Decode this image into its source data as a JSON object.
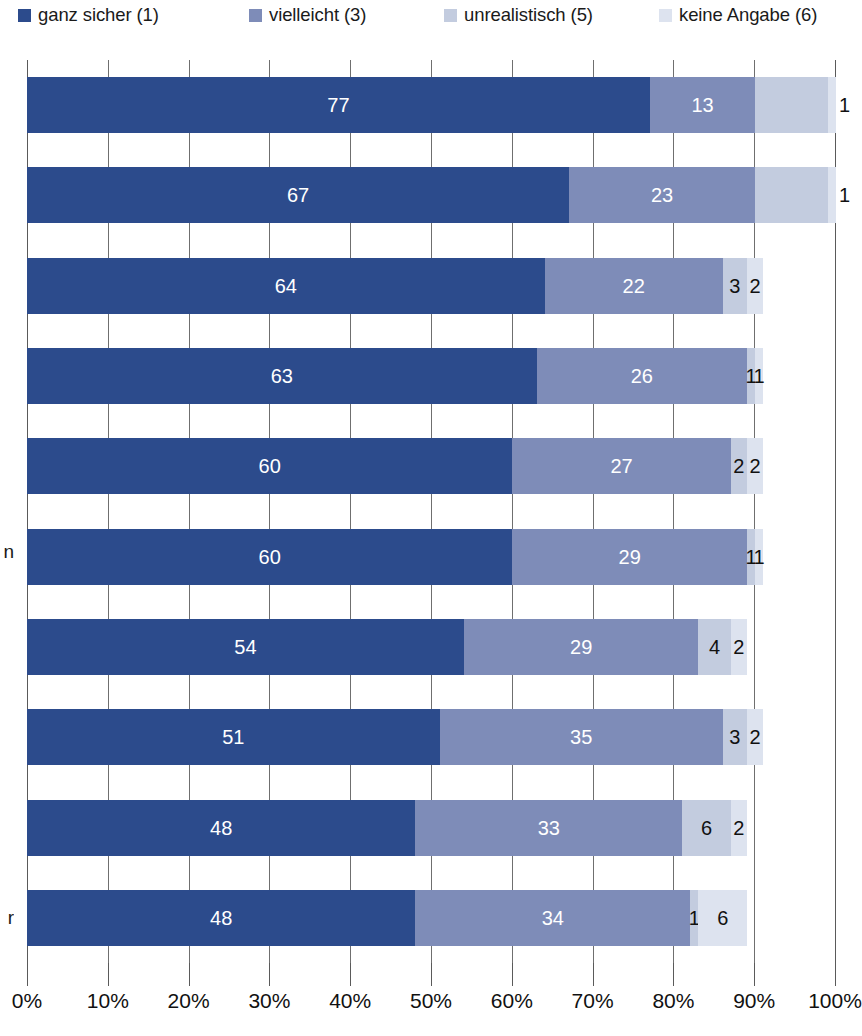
{
  "legend": {
    "items": [
      {
        "label": "ganz sicher (1)",
        "color": "#2c4b8c",
        "x": 18,
        "icon": "legend-swatch-series-1"
      },
      {
        "label": "vielleicht (3)",
        "color": "#7e8cb8",
        "x": 249,
        "icon": "legend-swatch-series-3"
      },
      {
        "label": "unrealistisch (5)",
        "color": "#c3ccdf",
        "x": 444,
        "icon": "legend-swatch-series-5"
      },
      {
        "label": "keine Angabe (6)",
        "color": "#dde3ef",
        "x": 659,
        "icon": "legend-swatch-series-6"
      }
    ]
  },
  "axis": {
    "ticks": [
      "0%",
      "10%",
      "20%",
      "30%",
      "40%",
      "50%",
      "60%",
      "70%",
      "80%",
      "90%",
      "100%"
    ],
    "min": 0,
    "max": 100,
    "step": 10,
    "unit": "%"
  },
  "category_fragments": [
    {
      "text": "n",
      "top": 542
    },
    {
      "text": "r",
      "top": 908
    }
  ],
  "chart_data": {
    "type": "bar",
    "orientation": "horizontal",
    "stacked": true,
    "normalized": true,
    "title": "",
    "xlabel": "",
    "ylabel": "",
    "xlim": [
      0,
      100
    ],
    "grid": true,
    "legend_position": "top",
    "categories": [
      "",
      "",
      "",
      "",
      "",
      "",
      "",
      "",
      "",
      ""
    ],
    "series": [
      {
        "name": "ganz sicher (1)",
        "color": "#2c4b8c",
        "values": [
          77,
          67,
          64,
          63,
          60,
          60,
          54,
          51,
          48,
          48
        ]
      },
      {
        "name": "vielleicht (3)",
        "color": "#7e8cb8",
        "values": [
          13,
          23,
          22,
          26,
          27,
          29,
          29,
          35,
          33,
          34
        ]
      },
      {
        "name": "unrealistisch (5)",
        "color": "#c3ccdf",
        "values": [
          9,
          9,
          3,
          1,
          2,
          1,
          4,
          3,
          6,
          1
        ]
      },
      {
        "name": "keine Angabe (6)",
        "color": "#dde3ef",
        "values": [
          1,
          1,
          2,
          1,
          2,
          1,
          2,
          2,
          2,
          6
        ]
      }
    ],
    "rows": [
      {
        "index": 0,
        "segments": [
          {
            "series": "ganz sicher (1)",
            "value": 77,
            "label": "77",
            "label_style": "inside"
          },
          {
            "series": "vielleicht (3)",
            "value": 13,
            "label": "13",
            "label_style": "inside"
          },
          {
            "series": "unrealistisch (5)",
            "value": 9,
            "label": "",
            "label_style": "none"
          },
          {
            "series": "keine Angabe (6)",
            "value": 1,
            "label": "1",
            "label_style": "outside-right"
          }
        ]
      },
      {
        "index": 1,
        "segments": [
          {
            "series": "ganz sicher (1)",
            "value": 67,
            "label": "67",
            "label_style": "inside"
          },
          {
            "series": "vielleicht (3)",
            "value": 23,
            "label": "23",
            "label_style": "inside"
          },
          {
            "series": "unrealistisch (5)",
            "value": 9,
            "label": "",
            "label_style": "none"
          },
          {
            "series": "keine Angabe (6)",
            "value": 1,
            "label": "1",
            "label_style": "outside-right"
          }
        ]
      },
      {
        "index": 2,
        "segments": [
          {
            "series": "ganz sicher (1)",
            "value": 64,
            "label": "64",
            "label_style": "inside"
          },
          {
            "series": "vielleicht (3)",
            "value": 22,
            "label": "22",
            "label_style": "inside"
          },
          {
            "series": "unrealistisch (5)",
            "value": 3,
            "label": "3",
            "label_style": "outside"
          },
          {
            "series": "keine Angabe (6)",
            "value": 2,
            "label": "2",
            "label_style": "outside"
          }
        ]
      },
      {
        "index": 3,
        "segments": [
          {
            "series": "ganz sicher (1)",
            "value": 63,
            "label": "63",
            "label_style": "inside"
          },
          {
            "series": "vielleicht (3)",
            "value": 26,
            "label": "26",
            "label_style": "inside"
          },
          {
            "series": "unrealistisch (5)",
            "value": 1,
            "label": "1",
            "label_style": "outside"
          },
          {
            "series": "keine Angabe (6)",
            "value": 1,
            "label": "1",
            "label_style": "outside"
          }
        ]
      },
      {
        "index": 4,
        "segments": [
          {
            "series": "ganz sicher (1)",
            "value": 60,
            "label": "60",
            "label_style": "inside"
          },
          {
            "series": "vielleicht (3)",
            "value": 27,
            "label": "27",
            "label_style": "inside"
          },
          {
            "series": "unrealistisch (5)",
            "value": 2,
            "label": "2",
            "label_style": "outside"
          },
          {
            "series": "keine Angabe (6)",
            "value": 2,
            "label": "2",
            "label_style": "outside"
          }
        ]
      },
      {
        "index": 5,
        "segments": [
          {
            "series": "ganz sicher (1)",
            "value": 60,
            "label": "60",
            "label_style": "inside"
          },
          {
            "series": "vielleicht (3)",
            "value": 29,
            "label": "29",
            "label_style": "inside"
          },
          {
            "series": "unrealistisch (5)",
            "value": 1,
            "label": "1",
            "label_style": "outside"
          },
          {
            "series": "keine Angabe (6)",
            "value": 1,
            "label": "1",
            "label_style": "outside"
          }
        ]
      },
      {
        "index": 6,
        "segments": [
          {
            "series": "ganz sicher (1)",
            "value": 54,
            "label": "54",
            "label_style": "inside"
          },
          {
            "series": "vielleicht (3)",
            "value": 29,
            "label": "29",
            "label_style": "inside"
          },
          {
            "series": "unrealistisch (5)",
            "value": 4,
            "label": "4",
            "label_style": "outside"
          },
          {
            "series": "keine Angabe (6)",
            "value": 2,
            "label": "2",
            "label_style": "outside"
          }
        ]
      },
      {
        "index": 7,
        "segments": [
          {
            "series": "ganz sicher (1)",
            "value": 51,
            "label": "51",
            "label_style": "inside"
          },
          {
            "series": "vielleicht (3)",
            "value": 35,
            "label": "35",
            "label_style": "inside"
          },
          {
            "series": "unrealistisch (5)",
            "value": 3,
            "label": "3",
            "label_style": "outside"
          },
          {
            "series": "keine Angabe (6)",
            "value": 2,
            "label": "2",
            "label_style": "outside"
          }
        ]
      },
      {
        "index": 8,
        "segments": [
          {
            "series": "ganz sicher (1)",
            "value": 48,
            "label": "48",
            "label_style": "inside"
          },
          {
            "series": "vielleicht (3)",
            "value": 33,
            "label": "33",
            "label_style": "inside"
          },
          {
            "series": "unrealistisch (5)",
            "value": 6,
            "label": "6",
            "label_style": "outside"
          },
          {
            "series": "keine Angabe (6)",
            "value": 2,
            "label": "2",
            "label_style": "outside"
          }
        ]
      },
      {
        "index": 9,
        "segments": [
          {
            "series": "ganz sicher (1)",
            "value": 48,
            "label": "48",
            "label_style": "inside"
          },
          {
            "series": "vielleicht (3)",
            "value": 34,
            "label": "34",
            "label_style": "inside"
          },
          {
            "series": "unrealistisch (5)",
            "value": 1,
            "label": "1",
            "label_style": "outside"
          },
          {
            "series": "keine Angabe (6)",
            "value": 6,
            "label": "6",
            "label_style": "outside"
          }
        ]
      }
    ]
  }
}
